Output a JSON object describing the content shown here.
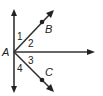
{
  "diagram": {
    "points": {
      "A": {
        "label": "A",
        "x": 14,
        "y": 52
      },
      "B": {
        "label": "B",
        "x": 42,
        "y": 22
      },
      "C": {
        "label": "C",
        "x": 42,
        "y": 80
      }
    },
    "rays": [
      {
        "name": "up",
        "from": "A",
        "to": [
          14,
          10
        ]
      },
      {
        "name": "down",
        "from": "A",
        "to": [
          14,
          92
        ]
      },
      {
        "name": "AB",
        "from": "A",
        "to": [
          53,
          11
        ]
      },
      {
        "name": "horizontal",
        "from": "A",
        "to": [
          94,
          52
        ]
      },
      {
        "name": "AC",
        "from": "A",
        "to": [
          53,
          91
        ]
      }
    ],
    "angle_labels": [
      "1",
      "2",
      "3",
      "4"
    ],
    "colors": {
      "line": "#333333",
      "text": "#222222"
    }
  }
}
